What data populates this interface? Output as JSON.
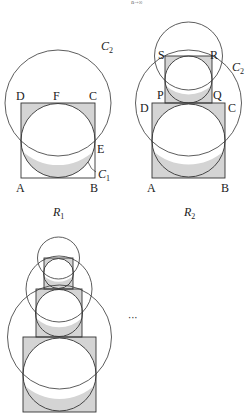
{
  "header": {
    "cutoff_text": "",
    "limit_subscript": "n→∞"
  },
  "figures": {
    "r1": {
      "caption": "R",
      "caption_sub": "1",
      "labels": {
        "A": "A",
        "B": "B",
        "C": "C",
        "D": "D",
        "E": "E",
        "F": "F",
        "C1": "C",
        "C1_sub": "1",
        "C2": "C",
        "C2_sub": "2"
      }
    },
    "r2": {
      "caption": "R",
      "caption_sub": "2",
      "labels": {
        "A": "A",
        "B": "B",
        "C": "C",
        "D": "D",
        "P": "P",
        "Q": "Q",
        "R": "R",
        "S": "S",
        "C2": "C",
        "C2_sub": "2"
      }
    },
    "continuation": {
      "ellipsis": "···"
    }
  },
  "colors": {
    "shade": "#d4d4d4",
    "stroke": "#333333"
  }
}
